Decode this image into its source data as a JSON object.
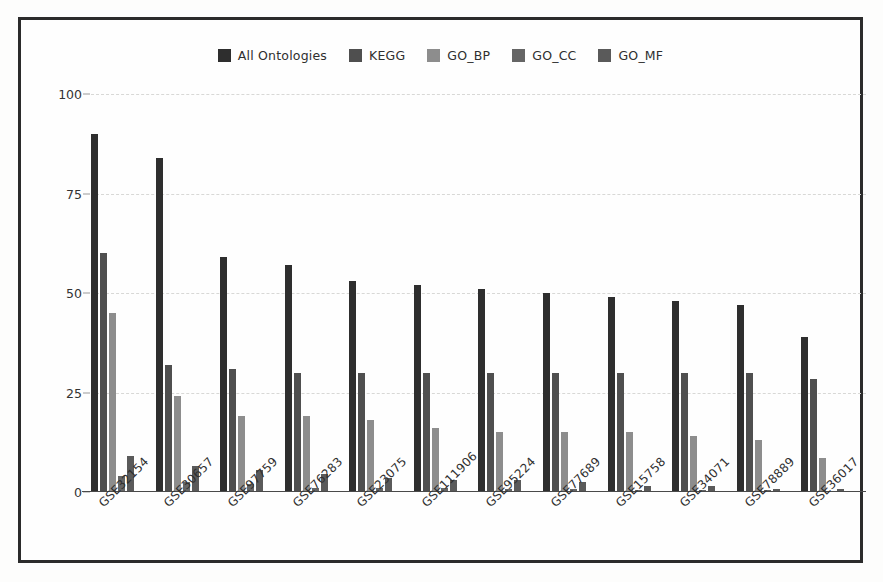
{
  "chart_data": {
    "type": "bar",
    "title": "",
    "xlabel": "",
    "ylabel": "",
    "ylim": [
      0,
      100
    ],
    "yticks": [
      0,
      25,
      50,
      75,
      100
    ],
    "grid": true,
    "legend_position": "top-center",
    "categories": [
      "GSE32154",
      "GSE30657",
      "GSE97759",
      "GSE76283",
      "GSE23075",
      "GSE111906",
      "GSE95224",
      "GSE77689",
      "GSE15758",
      "GSE34071",
      "GSE78889",
      "GSE36017"
    ],
    "series": [
      {
        "name": "All Ontologies",
        "color": "#2e2e2e",
        "values": [
          90,
          84,
          59,
          57,
          53,
          52,
          51,
          50,
          49,
          48,
          47,
          39
        ]
      },
      {
        "name": "KEGG",
        "color": "#4f4f4f",
        "values": [
          60,
          32,
          31,
          30,
          30,
          30,
          30,
          30,
          30,
          30,
          30,
          28.5
        ]
      },
      {
        "name": "GO_BP",
        "color": "#8d8d8d",
        "values": [
          45,
          24,
          19,
          19,
          18,
          16,
          15,
          15,
          15,
          14,
          13,
          8.5
        ]
      },
      {
        "name": "GO_CC",
        "color": "#656565",
        "values": [
          4,
          2.5,
          2,
          1,
          1,
          1,
          0.8,
          0.8,
          0.5,
          0.5,
          0.4,
          0.2
        ]
      },
      {
        "name": "GO_MF",
        "color": "#5a5a5a",
        "values": [
          9,
          6.5,
          5.5,
          4.5,
          3.5,
          3,
          3,
          2.5,
          1.5,
          1.5,
          0.8,
          0.8
        ]
      }
    ]
  },
  "legend": {
    "items": [
      {
        "label": "All Ontologies",
        "color": "#2e2e2e"
      },
      {
        "label": "KEGG",
        "color": "#4f4f4f"
      },
      {
        "label": "GO_BP",
        "color": "#8d8d8d"
      },
      {
        "label": "GO_CC",
        "color": "#656565"
      },
      {
        "label": "GO_MF",
        "color": "#5a5a5a"
      }
    ]
  },
  "axis": {
    "y_tick_labels": [
      "0",
      "25",
      "50",
      "75",
      "100"
    ]
  },
  "style": {
    "border_color": "#2b2b2b",
    "background": "#fefefe",
    "gridline_color": "#d8d8d6",
    "axis_line_color": "#4a4a4a",
    "text_color": "#2f2f2f"
  }
}
